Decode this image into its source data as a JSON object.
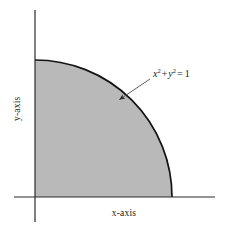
{
  "figure": {
    "name": "Quarter of the unit disk in the first quadrant",
    "background_color": "#ffffff",
    "axes": {
      "x_label": "x-axis",
      "y_label": "y-axis",
      "axis_color": "#2b2b2b",
      "origin": {
        "x": 35,
        "y": 197
      },
      "x_axis_extent": {
        "from": 14,
        "to": 215
      },
      "y_axis_extent": {
        "from": 10,
        "to": 222
      }
    },
    "region": {
      "fill_color": "#b9b9b9",
      "stroke_color": "#141414",
      "radius": 137,
      "arc_start": {
        "x": 35,
        "y": 60
      },
      "arc_end": {
        "x": 172,
        "y": 197
      }
    },
    "annotation": {
      "equation": {
        "base_x": "x",
        "exponent_x": "2",
        "operator_plus": "+",
        "base_y": "y",
        "exponent_y": "2",
        "operator_equals": "=",
        "value": "1",
        "plain_text": "x^2 + y^2 = 1"
      },
      "leader_line": {
        "from": {
          "x": 150,
          "y": 79
        },
        "to": {
          "x": 117,
          "y": 101
        },
        "color": "#4a4a4a",
        "has_arrowhead": true
      }
    }
  },
  "chart_data": {
    "type": "area",
    "title": "",
    "subtitle": "",
    "xlabel": "x-axis",
    "ylabel": "y-axis",
    "xlim": [
      0,
      1.47
    ],
    "ylim": [
      0,
      1.36
    ],
    "grid": false,
    "legend": "none",
    "annotations": [
      {
        "text": "x^2 + y^2 = 1",
        "display": "x² + y² = 1",
        "points_to_curve": true,
        "anchor_xy": [
          0.6,
          0.8
        ]
      }
    ],
    "series": [
      {
        "name": "x^2 + y^2 = 1",
        "kind": "quarter-circle-arc",
        "radius": 1,
        "quadrant": 1,
        "filled": true,
        "fill_color": "#b9b9b9",
        "stroke_color": "#141414",
        "x": [
          0.0,
          0.1,
          0.2,
          0.3,
          0.4,
          0.5,
          0.6,
          0.7,
          0.8,
          0.9,
          0.95,
          1.0
        ],
        "y": [
          1.0,
          0.995,
          0.98,
          0.954,
          0.917,
          0.866,
          0.8,
          0.714,
          0.6,
          0.436,
          0.312,
          0.0
        ]
      }
    ]
  }
}
